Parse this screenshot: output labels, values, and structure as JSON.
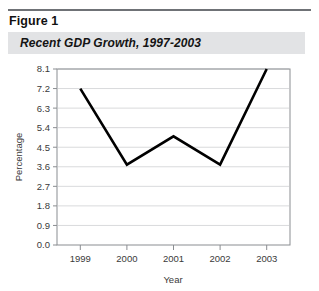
{
  "figure": {
    "label": "Figure 1",
    "title": "Recent GDP Growth, 1997-2003"
  },
  "colors": {
    "rule": "#6f7276",
    "title_band": "#e2e3e5",
    "line": "#000000",
    "grid": "#d9dadc",
    "plot_border": "#8a8d91",
    "text": "#3a3a3a"
  },
  "chart_data": {
    "type": "line",
    "title": "Recent GDP Growth, 1997-2003",
    "xlabel": "Year",
    "ylabel": "Percentage",
    "categories": [
      "1999",
      "2000",
      "2001",
      "2002",
      "2003"
    ],
    "values": [
      7.2,
      3.7,
      5.0,
      3.7,
      8.1
    ],
    "series": [
      {
        "name": "GDP Growth",
        "values": [
          7.2,
          3.7,
          5.0,
          3.7,
          8.1
        ]
      }
    ],
    "x_tick_labels": [
      "1999",
      "2000",
      "2001",
      "2002",
      "2003"
    ],
    "y_tick_labels": [
      "0.0",
      "0.9",
      "1.8",
      "2.7",
      "3.6",
      "4.5",
      "5.4",
      "6.3",
      "7.2",
      "8.1"
    ],
    "y_tick_values": [
      0.0,
      0.9,
      1.8,
      2.7,
      3.6,
      4.5,
      5.4,
      6.3,
      7.2,
      8.1
    ],
    "ylim": [
      0.0,
      8.1
    ],
    "grid": true,
    "legend": false,
    "legend_position": "none"
  }
}
